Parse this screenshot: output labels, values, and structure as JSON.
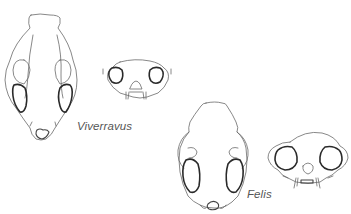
{
  "figure": {
    "specimens": [
      {
        "name": "Viverravus",
        "views": [
          "dorsal-view",
          "frontal-view"
        ]
      },
      {
        "name": "Felis",
        "views": [
          "dorsal-view",
          "frontal-view"
        ]
      }
    ],
    "labels": {
      "viverravus": "Viverravus",
      "felis": "Felis"
    },
    "colors": {
      "outline": "#6a6a6a",
      "orbit_outline": "#2a2a2a",
      "label": "#555555",
      "background": "#ffffff"
    }
  }
}
